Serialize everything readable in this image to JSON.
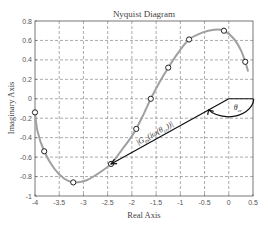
{
  "chart_data": {
    "type": "line",
    "title": "Nyquist Diagram",
    "xlabel": "Real Axis",
    "ylabel": "Imaginary Axis",
    "xlim": [
      -4,
      0.5
    ],
    "ylim": [
      -1,
      0.8
    ],
    "grid": true,
    "x_ticks": [
      "-4",
      "-3.5",
      "-3",
      "-2.5",
      "-2",
      "-1.5",
      "-1",
      "-0.5",
      "0",
      "0.5"
    ],
    "x_tick_values": [
      -4,
      -3.5,
      -3,
      -2.5,
      -2,
      -1.5,
      -1,
      -0.5,
      0,
      0.5
    ],
    "y_ticks": [
      "0.8",
      "0.6",
      "0.4",
      "0.2",
      "0",
      "-0.2",
      "-0.4",
      "-0.6",
      "-0.8",
      "-1"
    ],
    "y_tick_values": [
      0.8,
      0.6,
      0.4,
      0.2,
      0,
      -0.2,
      -0.4,
      -0.6,
      -0.8,
      -1
    ],
    "series": [
      {
        "name": "Nyquist curve",
        "color": "#a0a0a0",
        "curve": [
          [
            -4.0,
            -0.14
          ],
          [
            -3.95,
            -0.33
          ],
          [
            -3.81,
            -0.54
          ],
          [
            -3.6,
            -0.72
          ],
          [
            -3.4,
            -0.82
          ],
          [
            -3.21,
            -0.86
          ],
          [
            -2.95,
            -0.84
          ],
          [
            -2.7,
            -0.77
          ],
          [
            -2.43,
            -0.67
          ],
          [
            -2.2,
            -0.52
          ],
          [
            -2.05,
            -0.42
          ],
          [
            -1.91,
            -0.31
          ],
          [
            -1.75,
            -0.15
          ],
          [
            -1.61,
            0.0
          ],
          [
            -1.43,
            0.17
          ],
          [
            -1.25,
            0.32
          ],
          [
            -1.05,
            0.47
          ],
          [
            -0.82,
            0.61
          ],
          [
            -0.55,
            0.68
          ],
          [
            -0.3,
            0.71
          ],
          [
            -0.1,
            0.7
          ],
          [
            0.1,
            0.62
          ],
          [
            0.25,
            0.5
          ],
          [
            0.34,
            0.38
          ],
          [
            0.4,
            0.28
          ]
        ],
        "markers": [
          [
            -4.0,
            -0.14
          ],
          [
            -3.81,
            -0.54
          ],
          [
            -3.21,
            -0.86
          ],
          [
            -2.43,
            -0.67
          ],
          [
            -1.91,
            -0.31
          ],
          [
            -1.61,
            0.0
          ],
          [
            -1.25,
            0.32
          ],
          [
            -0.82,
            0.61
          ],
          [
            -0.1,
            0.7
          ],
          [
            0.34,
            0.38
          ]
        ]
      }
    ],
    "annotations": {
      "vector": {
        "from": [
          0,
          0
        ],
        "to": [
          -2.43,
          -0.67
        ],
        "color": "#111111"
      },
      "vector_label": "|G",
      "vector_label_sub": "ps",
      "vector_label_mid": "(iω(θ",
      "vector_label_sub2": "cr",
      "vector_label_end": "))|",
      "angle_label": "θ",
      "angle_label_sub": "cr"
    }
  }
}
